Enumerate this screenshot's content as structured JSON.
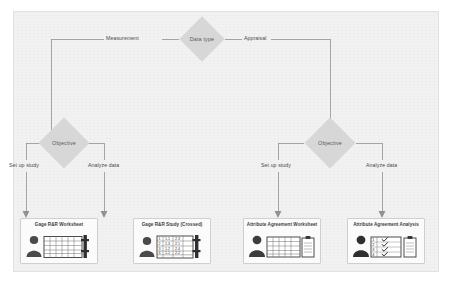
{
  "diagram": {
    "background_color": "#f2f2f2",
    "shape_fill_color": "#d7d7d7",
    "line_color": "#8f8f8f",
    "root": {
      "id": "data-type",
      "label": "Data type",
      "shape": "diamond"
    },
    "branches": [
      {
        "id": "measurement",
        "label": "Measurement",
        "decision": {
          "id": "objective-left",
          "label": "Objective",
          "shape": "diamond"
        },
        "options": [
          {
            "id": "setup-study-left",
            "label": "Set up study",
            "target": {
              "id": "gage-rr-worksheet",
              "label": "Gage R&R Worksheet",
              "icon": "person-spreadsheet-icon"
            }
          },
          {
            "id": "analyze-data-left",
            "label": "Analyze data",
            "target": {
              "id": "gage-rr-study-crossed",
              "label": "Gage R&R Study (Crossed)",
              "icon": "person-datatable-icon"
            }
          }
        ]
      },
      {
        "id": "appraisal",
        "label": "Appraisal",
        "decision": {
          "id": "objective-right",
          "label": "Objective",
          "shape": "diamond"
        },
        "options": [
          {
            "id": "setup-study-right",
            "label": "Set up study",
            "target": {
              "id": "attribute-agreement-worksheet",
              "label": "Attribute Agreement Worksheet",
              "icon": "person-spreadsheet-clipboard-icon"
            }
          },
          {
            "id": "analyze-data-right",
            "label": "Analyze data",
            "target": {
              "id": "attribute-agreement-analysis",
              "label": "Attribute Agreement Analysis",
              "icon": "person-checklist-clipboard-icon"
            }
          }
        ]
      }
    ]
  }
}
